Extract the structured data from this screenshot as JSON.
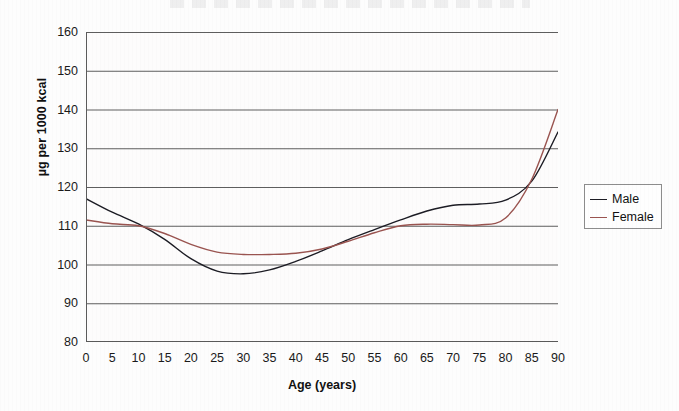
{
  "chart_data": {
    "type": "line",
    "title": "",
    "xlabel": "Age (years)",
    "ylabel": "µg per 1000 kcal",
    "xlim": [
      0,
      90
    ],
    "ylim": [
      80,
      160
    ],
    "xticks": [
      0,
      5,
      10,
      15,
      20,
      25,
      30,
      35,
      40,
      45,
      50,
      55,
      60,
      65,
      70,
      75,
      80,
      85,
      90
    ],
    "yticks": [
      80,
      90,
      100,
      110,
      120,
      130,
      140,
      150,
      160
    ],
    "grid": "horizontal",
    "legend_position": "right-outside",
    "x": [
      0,
      5,
      10,
      15,
      20,
      25,
      30,
      35,
      40,
      45,
      50,
      55,
      60,
      65,
      70,
      75,
      80,
      85,
      90
    ],
    "series": [
      {
        "name": "Male",
        "color": "#1c1c24",
        "values": [
          117.0,
          113.5,
          110.5,
          106.5,
          101.5,
          98.3,
          97.6,
          98.6,
          100.8,
          103.5,
          106.4,
          109.0,
          111.5,
          113.8,
          115.3,
          115.6,
          116.6,
          121.5,
          134.2
        ]
      },
      {
        "name": "Female",
        "color": "#9a5450",
        "values": [
          111.5,
          110.5,
          110.0,
          108.0,
          105.2,
          103.2,
          102.6,
          102.6,
          102.9,
          104.0,
          106.0,
          108.2,
          110.0,
          110.4,
          110.3,
          110.2,
          112.0,
          122.0,
          140.0
        ]
      }
    ]
  },
  "legend": {
    "items": [
      {
        "label": "Male",
        "color": "#1c1c24"
      },
      {
        "label": "Female",
        "color": "#9a5450"
      }
    ]
  },
  "axes": {
    "x_title": "Age (years)",
    "y_title": "µg per 1000 kcal"
  }
}
